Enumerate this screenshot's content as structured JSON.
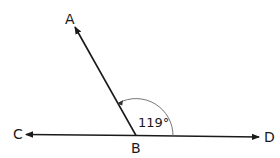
{
  "diagram": {
    "type": "angle",
    "points": {
      "A": {
        "label": "A"
      },
      "B": {
        "label": "B"
      },
      "C": {
        "label": "C"
      },
      "D": {
        "label": "D"
      }
    },
    "rays": [
      "BA",
      "BC",
      "BD"
    ],
    "angle": {
      "name": "ABD",
      "value_label": "119°",
      "degrees": 119
    },
    "colors": {
      "line": "#1a1a1a",
      "arc": "#555555"
    }
  }
}
